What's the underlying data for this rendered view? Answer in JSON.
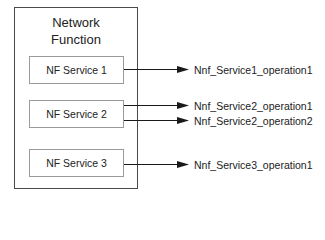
{
  "diagram": {
    "container": {
      "title_line1": "Network",
      "title_line2": "Function"
    },
    "services": [
      {
        "label": "NF Service 1",
        "operations": [
          "Nnf_Service1_operation1"
        ]
      },
      {
        "label": "NF Service 2",
        "operations": [
          "Nnf_Service2_operation1",
          "Nnf_Service2_operation2"
        ]
      },
      {
        "label": "NF Service 3",
        "operations": [
          "Nnf_Service3_operation1"
        ]
      }
    ],
    "colors": {
      "outer_border": "#4a4a4a",
      "service_border": "#9a9a9a",
      "arrow": "#1a1a1a"
    }
  }
}
